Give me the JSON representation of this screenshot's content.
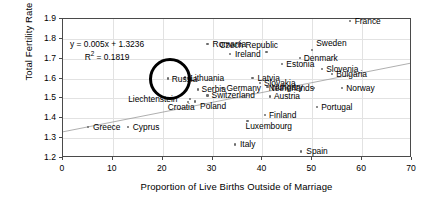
{
  "chart_data": {
    "type": "scatter",
    "title": "",
    "xlabel": "Proportion of Live Births Outside of Marriage",
    "ylabel": "Total Fertility Rate",
    "xlim": [
      0,
      70
    ],
    "ylim": [
      1.2,
      1.9
    ],
    "xticks": [
      "0",
      "10",
      "20",
      "30",
      "40",
      "50",
      "60",
      "70"
    ],
    "yticks": [
      "1.2",
      "1.3",
      "1.4",
      "1.5",
      "1.6",
      "1.7",
      "1.8",
      "1.9"
    ],
    "grid": true,
    "legend": "none",
    "trendline": {
      "equation": "y = 0.005x + 1.3236",
      "r_squared_label": "R",
      "r_squared_sup": "2",
      "r_squared_value": " = 0.1819",
      "slope": 0.005,
      "intercept": 1.3236,
      "r2": 0.1819
    },
    "annotations": [
      {
        "name": "russia-highlight-circle",
        "shape": "circle",
        "target": "Russia"
      }
    ],
    "points": [
      {
        "label": "France",
        "x": 57.5,
        "y": 1.89,
        "lx": 5,
        "ly": -4
      },
      {
        "label": "Romania",
        "x": 29.0,
        "y": 1.775,
        "lx": 5,
        "ly": -4
      },
      {
        "label": "Czech Republic",
        "x": 40.8,
        "y": 1.735,
        "lx": -47,
        "ly": -11
      },
      {
        "label": "Sweden",
        "x": 50.0,
        "y": 1.745,
        "lx": 4,
        "ly": -11
      },
      {
        "label": "Ireland",
        "x": 33.5,
        "y": 1.722,
        "lx": 5,
        "ly": -4
      },
      {
        "label": "Denmark",
        "x": 47.5,
        "y": 1.703,
        "lx": 4,
        "ly": -4
      },
      {
        "label": "Estonia",
        "x": 44.0,
        "y": 1.675,
        "lx": 4,
        "ly": -4
      },
      {
        "label": "Slovenia",
        "x": 52.0,
        "y": 1.648,
        "lx": 4,
        "ly": -4
      },
      {
        "label": "Bulgaria",
        "x": 54.0,
        "y": 1.625,
        "lx": 4,
        "ly": -4
      },
      {
        "label": "Lithuania",
        "x": 24.5,
        "y": 1.605,
        "lx": 5,
        "ly": -4
      },
      {
        "label": "Russia",
        "x": 21.0,
        "y": 1.6,
        "lx": 4,
        "ly": -4
      },
      {
        "label": "Latvia",
        "x": 38.0,
        "y": 1.602,
        "lx": 5,
        "ly": -4
      },
      {
        "label": "Slovakia",
        "x": 39.5,
        "y": 1.578,
        "lx": 4,
        "ly": -4
      },
      {
        "label": "Hungary",
        "x": 41.0,
        "y": 1.556,
        "lx": 4,
        "ly": -4
      },
      {
        "label": "Netherlands",
        "x": 50.3,
        "y": 1.553,
        "lx": -45,
        "ly": -4
      },
      {
        "label": "Norway",
        "x": 56.0,
        "y": 1.553,
        "lx": 4,
        "ly": -4
      },
      {
        "label": "Serbia",
        "x": 27.0,
        "y": 1.545,
        "lx": 4,
        "ly": -4
      },
      {
        "label": "Germany",
        "x": 32.0,
        "y": 1.553,
        "lx": 4,
        "ly": -4
      },
      {
        "label": "Switzerland",
        "x": 29.0,
        "y": 1.515,
        "lx": 4,
        "ly": -4
      },
      {
        "label": "Austria",
        "x": 41.5,
        "y": 1.51,
        "lx": 4,
        "ly": -4
      },
      {
        "label": "Liechtenstein",
        "x": 25.5,
        "y": 1.498,
        "lx": -62,
        "ly": -4
      },
      {
        "label": "Croatia",
        "x": 25.0,
        "y": 1.48,
        "lx": -20,
        "ly": 1
      },
      {
        "label": "Poland",
        "x": 26.5,
        "y": 1.485,
        "lx": 5,
        "ly": 1
      },
      {
        "label": "Portugal",
        "x": 51.0,
        "y": 1.457,
        "lx": 4,
        "ly": -4
      },
      {
        "label": "Finland",
        "x": 40.5,
        "y": 1.418,
        "lx": 4,
        "ly": -4
      },
      {
        "label": "Greece",
        "x": 5.0,
        "y": 1.355,
        "lx": 5,
        "ly": -4
      },
      {
        "label": "Cyprus",
        "x": 13.0,
        "y": 1.355,
        "lx": 5,
        "ly": -4
      },
      {
        "label": "Luxembourg",
        "x": 37.0,
        "y": 1.385,
        "lx": -2,
        "ly": 1
      },
      {
        "label": "Italy",
        "x": 34.5,
        "y": 1.268,
        "lx": 5,
        "ly": -4
      },
      {
        "label": "Spain",
        "x": 47.8,
        "y": 1.233,
        "lx": 5,
        "ly": -4
      }
    ]
  }
}
